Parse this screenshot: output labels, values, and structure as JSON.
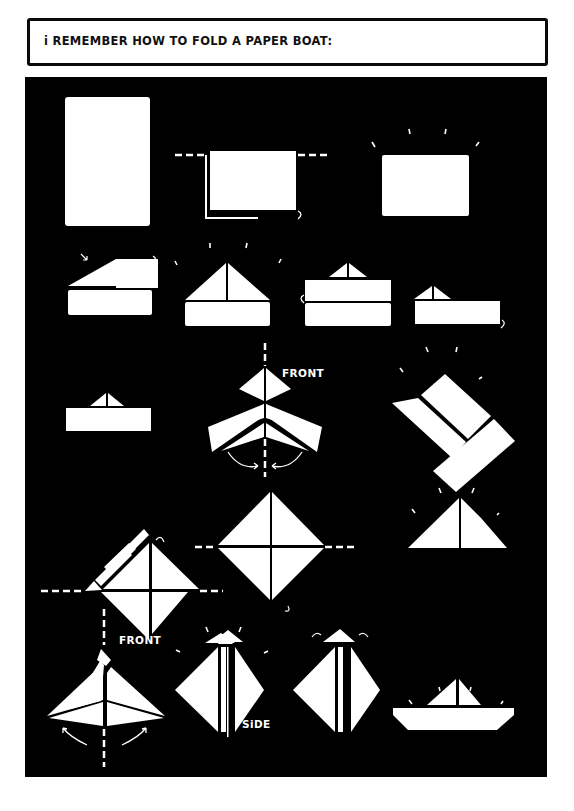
{
  "title": "i REMEMBER HOW TO FOLD A PAPER BOAT:",
  "colors": {
    "background": "#ffffff",
    "panel": "#000000",
    "paper": "#ffffff",
    "ink": "#000000"
  },
  "labels": {
    "front_1": "FRONT",
    "side_1": "SiDE",
    "front_2": "FRONT",
    "side_2": "SiDE"
  },
  "steps": [
    {
      "n": 1,
      "desc": "tall rectangle sheet"
    },
    {
      "n": 2,
      "desc": "fold in half along dashed line"
    },
    {
      "n": 3,
      "desc": "folded rectangle"
    },
    {
      "n": 4,
      "desc": "fold top-left corner down"
    },
    {
      "n": 5,
      "desc": "triangle hat on strip"
    },
    {
      "n": 6,
      "desc": "fold bottom strip up"
    },
    {
      "n": 7,
      "desc": "flip and fold strip"
    },
    {
      "n": 8,
      "desc": "hat with strip"
    },
    {
      "n": 9,
      "desc": "open sides, front view"
    },
    {
      "n": 10,
      "desc": "flatten into square (side)"
    },
    {
      "n": 11,
      "desc": "fold bottom up along dashed line"
    },
    {
      "n": 12,
      "desc": "diamond with folds"
    },
    {
      "n": 13,
      "desc": "triangle"
    },
    {
      "n": 14,
      "desc": "open sides, front view"
    },
    {
      "n": 15,
      "desc": "flatten into diamond (side)"
    },
    {
      "n": 16,
      "desc": "pull tips apart"
    },
    {
      "n": 17,
      "desc": "finished paper boat"
    }
  ]
}
